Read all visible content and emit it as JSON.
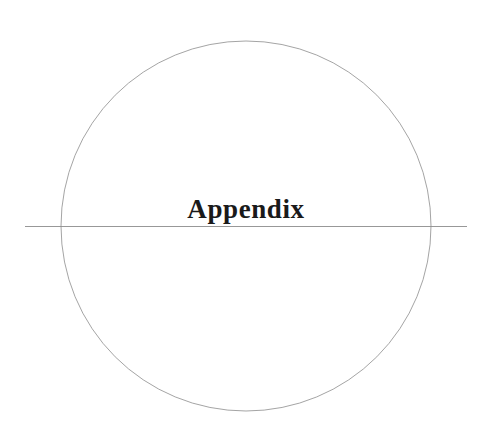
{
  "page": {
    "title": "Appendix"
  },
  "graphics": {
    "circle": {
      "cx": 246,
      "cy": 226,
      "r": 185,
      "stroke": "#9a9a9a"
    },
    "divider": {
      "x1": 25,
      "x2": 467,
      "y": 226,
      "stroke": "#8c8c8c"
    }
  }
}
